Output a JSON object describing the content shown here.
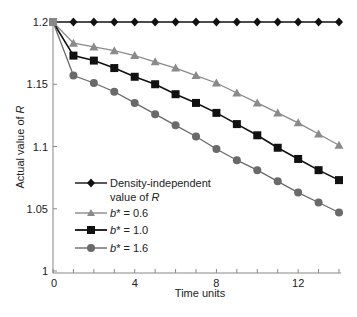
{
  "chart_data": {
    "type": "line",
    "title": "",
    "xlabel": "Time units",
    "ylabel": "Actual value of R",
    "ylabel_italic_part": "R",
    "xlim": [
      0,
      14
    ],
    "ylim": [
      1,
      1.2
    ],
    "x_ticks": [
      0,
      4,
      8,
      12
    ],
    "x_minor_ticks": [
      1,
      2,
      3,
      5,
      6,
      7,
      9,
      10,
      11,
      13,
      14
    ],
    "y_ticks": [
      1,
      1.05,
      1.1,
      1.15,
      1.2
    ],
    "y_tick_labels": [
      "1",
      "1.05",
      "1.1",
      "1.15",
      "1.2"
    ],
    "grid": false,
    "legend_position": "lower-left inside",
    "x": [
      0,
      1,
      2,
      3,
      4,
      5,
      6,
      7,
      8,
      9,
      10,
      11,
      12,
      13,
      14
    ],
    "series": [
      {
        "name": "Density-independent value of R",
        "legend_line1": "Density-independent",
        "legend_line2": "value of R",
        "marker": "diamond",
        "color": "#111111",
        "values": [
          1.2,
          1.2,
          1.2,
          1.2,
          1.2,
          1.2,
          1.2,
          1.2,
          1.2,
          1.2,
          1.2,
          1.2,
          1.2,
          1.2,
          1.2
        ]
      },
      {
        "name": "b* = 0.6",
        "legend_prefix": "b*",
        "legend_suffix": " = 0.6",
        "marker": "triangle",
        "color": "#8a8a8a",
        "values": [
          1.2,
          1.183,
          1.18,
          1.177,
          1.173,
          1.168,
          1.163,
          1.157,
          1.151,
          1.143,
          1.135,
          1.127,
          1.119,
          1.11,
          1.101
        ]
      },
      {
        "name": "b* = 1.0",
        "legend_prefix": "b*",
        "legend_suffix": " = 1.0",
        "marker": "square",
        "color": "#111111",
        "values": [
          1.2,
          1.173,
          1.169,
          1.163,
          1.156,
          1.15,
          1.142,
          1.135,
          1.127,
          1.118,
          1.109,
          1.099,
          1.09,
          1.081,
          1.073
        ]
      },
      {
        "name": "b* = 1.6",
        "legend_prefix": "b*",
        "legend_suffix": " = 1.6",
        "marker": "circle",
        "color": "#6a6a6a",
        "values": [
          1.2,
          1.157,
          1.151,
          1.144,
          1.135,
          1.126,
          1.117,
          1.108,
          1.098,
          1.089,
          1.081,
          1.072,
          1.063,
          1.055,
          1.047
        ]
      }
    ]
  }
}
